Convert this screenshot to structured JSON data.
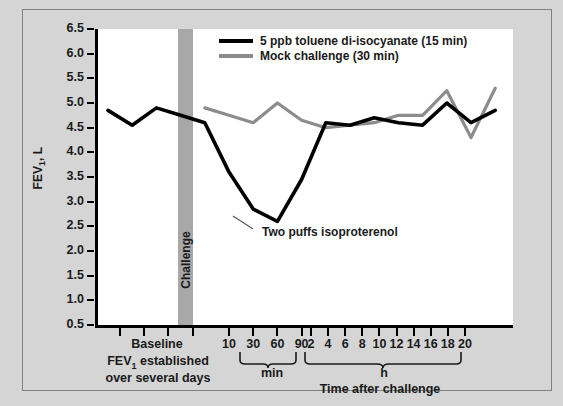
{
  "chart_data": {
    "type": "line",
    "title": "",
    "xlabel": "Time after challenge",
    "ylabel": "FEV1, L",
    "ylabel_display": "FEV",
    "ylabel_sub": "1",
    "ylabel_suffix": ", L",
    "ylim": [
      0.5,
      6.5
    ],
    "ytick_labels": [
      "6.5",
      "6.0",
      "5.5",
      "5.0",
      "4.5",
      "4.0",
      "3.5",
      "3.0",
      "2.5",
      "2.0",
      "1.5",
      "1.0",
      "0.5"
    ],
    "ytick_values": [
      6.5,
      6.0,
      5.5,
      5.0,
      4.5,
      4.0,
      3.5,
      3.0,
      2.5,
      2.0,
      1.5,
      1.0,
      0.5
    ],
    "grid": false,
    "legend_position": "top-center",
    "xtick_minutes": [
      "10",
      "30",
      "60",
      "90"
    ],
    "xtick_hours": [
      "2",
      "4",
      "6",
      "8",
      "10",
      "12",
      "14",
      "16",
      "18",
      "20"
    ],
    "minutes_bracket_label": "min",
    "hours_bracket_label": "h",
    "baseline_label": "Baseline",
    "baseline_sub_line1": "FEV1 established",
    "baseline_sub_line1_pre": "FEV",
    "baseline_sub_line1_sub": "1",
    "baseline_sub_line1_post": " established",
    "baseline_sub_line2": "over several days",
    "challenge_band_label": "Challenge",
    "annotation": "Two puffs isoproterenol",
    "series": [
      {
        "name": "5 ppb toluene di-isocyanate (15 min)",
        "color": "#000000",
        "x": [
          0,
          1,
          2,
          3,
          4,
          5,
          6,
          7,
          8,
          9,
          10,
          11,
          12,
          13,
          14,
          15,
          16
        ],
        "x_labels": [
          "baseline-1",
          "baseline-2",
          "baseline-3",
          "baseline-4",
          "challenge",
          "10 min",
          "30 min",
          "60 min",
          "90 min",
          "2 h",
          "4 h",
          "6 h",
          "8 h",
          "10 h",
          "12 h",
          "16 h",
          "20 h"
        ],
        "values": [
          4.85,
          4.55,
          4.9,
          4.75,
          4.6,
          3.6,
          2.85,
          2.6,
          3.45,
          4.6,
          4.55,
          4.7,
          4.6,
          4.55,
          5.0,
          4.6,
          4.85
        ]
      },
      {
        "name": "Mock challenge (30 min)",
        "color": "#8c8c8c",
        "x": [
          4,
          5,
          6,
          7,
          8,
          9,
          10,
          11,
          12,
          13,
          14,
          15,
          16
        ],
        "x_labels": [
          "challenge",
          "10 min",
          "30 min",
          "60 min",
          "90 min",
          "2 h",
          "4 h",
          "6 h",
          "8 h",
          "10 h",
          "12 h",
          "16 h",
          "20 h"
        ],
        "values": [
          4.9,
          4.75,
          4.6,
          5.0,
          4.65,
          4.5,
          4.55,
          4.6,
          4.75,
          4.75,
          5.25,
          4.3,
          5.3
        ]
      }
    ],
    "legend": [
      {
        "label": "5 ppb toluene di-isocyanate (15 min)",
        "color": "#000000"
      },
      {
        "label": "Mock challenge (30 min)",
        "color": "#8c8c8c"
      }
    ]
  },
  "colors": {
    "background": "#d5d5d5",
    "plot_background": "#ffffff",
    "frame_border": "#808080",
    "axis": "#000000",
    "challenge_band": "#a8a8a8",
    "tdi_line": "#000000",
    "mock_line": "#8c8c8c",
    "text": "#1a1a1a"
  }
}
